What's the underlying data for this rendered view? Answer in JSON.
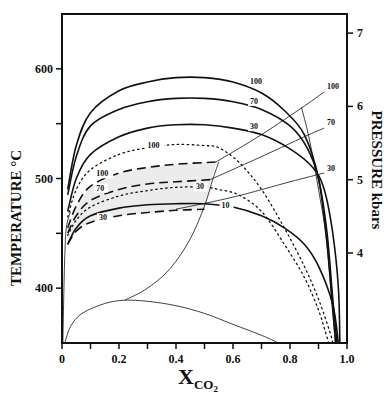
{
  "chart_data": {
    "type": "line",
    "title": "",
    "xlabel": "X",
    "xlabel_subscript": "CO",
    "xlabel_subscript2": "2",
    "ylabel": "TEMPERATURE  °C",
    "y2label": "PRESSURE  kbars",
    "xlim": [
      0,
      1.0
    ],
    "ylim": [
      350,
      650
    ],
    "y2lim": [
      3.3,
      7.3
    ],
    "x_ticks": [
      0,
      0.1,
      0.2,
      0.3,
      0.4,
      0.5,
      0.6,
      0.7,
      0.8,
      0.9,
      1.0
    ],
    "x_tick_labels": [
      {
        "value": 0,
        "label": "0"
      },
      {
        "value": 0.2,
        "label": "0.2"
      },
      {
        "value": 0.4,
        "label": "0.4"
      },
      {
        "value": 0.6,
        "label": "0.6"
      },
      {
        "value": 0.8,
        "label": "0.8"
      },
      {
        "value": 1.0,
        "label": "1.0"
      }
    ],
    "y_ticks": [
      400,
      450,
      500,
      550,
      600
    ],
    "y_tick_labels": [
      {
        "value": 400,
        "label": "400"
      },
      {
        "value": 500,
        "label": "500"
      },
      {
        "value": 600,
        "label": "600"
      }
    ],
    "y2_ticks": [
      {
        "value": 4,
        "label": "4"
      },
      {
        "value": 5,
        "label": "5"
      },
      {
        "value": 6,
        "label": "6"
      },
      {
        "value": 7,
        "label": "7"
      }
    ],
    "grid": false,
    "legend": "none (curves labeled inline by mole % / pressure)",
    "series": [
      {
        "name": "solid 100",
        "style": "solid",
        "label": "100",
        "points": [
          [
            0.02,
            490
          ],
          [
            0.05,
            530
          ],
          [
            0.1,
            560
          ],
          [
            0.2,
            580
          ],
          [
            0.3,
            588
          ],
          [
            0.4,
            592
          ],
          [
            0.5,
            592
          ],
          [
            0.6,
            588
          ],
          [
            0.7,
            578
          ],
          [
            0.78,
            562
          ],
          [
            0.85,
            540
          ],
          [
            0.9,
            500
          ],
          [
            0.93,
            440
          ],
          [
            0.95,
            380
          ],
          [
            0.96,
            350
          ]
        ]
      },
      {
        "name": "solid 70",
        "style": "solid",
        "label": "70",
        "points": [
          [
            0.02,
            485
          ],
          [
            0.05,
            520
          ],
          [
            0.1,
            548
          ],
          [
            0.2,
            563
          ],
          [
            0.3,
            570
          ],
          [
            0.4,
            573
          ],
          [
            0.5,
            573
          ],
          [
            0.6,
            570
          ],
          [
            0.7,
            563
          ],
          [
            0.8,
            548
          ],
          [
            0.86,
            528
          ],
          [
            0.9,
            500
          ],
          [
            0.93,
            450
          ],
          [
            0.95,
            390
          ],
          [
            0.965,
            350
          ]
        ]
      },
      {
        "name": "solid 30",
        "style": "solid",
        "label": "30",
        "points": [
          [
            0.02,
            470
          ],
          [
            0.05,
            500
          ],
          [
            0.1,
            522
          ],
          [
            0.2,
            538
          ],
          [
            0.3,
            546
          ],
          [
            0.4,
            549
          ],
          [
            0.5,
            549
          ],
          [
            0.6,
            546
          ],
          [
            0.7,
            540
          ],
          [
            0.8,
            527
          ],
          [
            0.88,
            510
          ],
          [
            0.92,
            490
          ],
          [
            0.95,
            450
          ],
          [
            0.97,
            400
          ],
          [
            0.975,
            350
          ]
        ]
      },
      {
        "name": "dotted 100",
        "style": "dotted",
        "label": "100",
        "points": [
          [
            0.02,
            465
          ],
          [
            0.05,
            490
          ],
          [
            0.1,
            508
          ],
          [
            0.2,
            522
          ],
          [
            0.3,
            528
          ],
          [
            0.4,
            531
          ],
          [
            0.5,
            530
          ],
          [
            0.55,
            528
          ],
          [
            0.62,
            515
          ],
          [
            0.7,
            490
          ],
          [
            0.78,
            455
          ],
          [
            0.85,
            420
          ],
          [
            0.9,
            390
          ],
          [
            0.94,
            360
          ],
          [
            0.95,
            350
          ]
        ]
      },
      {
        "name": "dashed 100",
        "style": "dashed",
        "label": "100",
        "points": [
          [
            0.02,
            455
          ],
          [
            0.05,
            475
          ],
          [
            0.1,
            493
          ],
          [
            0.2,
            505
          ],
          [
            0.3,
            510
          ],
          [
            0.4,
            513
          ],
          [
            0.54,
            515
          ]
        ]
      },
      {
        "name": "dashed 70",
        "style": "dashed",
        "label": "70",
        "points": [
          [
            0.02,
            450
          ],
          [
            0.05,
            466
          ],
          [
            0.1,
            480
          ],
          [
            0.2,
            490
          ],
          [
            0.3,
            495
          ],
          [
            0.4,
            497
          ],
          [
            0.52,
            499
          ]
        ]
      },
      {
        "name": "dotted 30",
        "style": "dotted",
        "label": "30",
        "points": [
          [
            0.02,
            448
          ],
          [
            0.05,
            462
          ],
          [
            0.1,
            474
          ],
          [
            0.2,
            484
          ],
          [
            0.3,
            489
          ],
          [
            0.4,
            492
          ],
          [
            0.5,
            492
          ],
          [
            0.55,
            490
          ],
          [
            0.62,
            485
          ],
          [
            0.7,
            470
          ],
          [
            0.78,
            440
          ],
          [
            0.85,
            410
          ],
          [
            0.9,
            380
          ],
          [
            0.93,
            355
          ],
          [
            0.935,
            350
          ]
        ]
      },
      {
        "name": "solid 10",
        "style": "solid",
        "label": "10",
        "points": [
          [
            0.02,
            440
          ],
          [
            0.05,
            455
          ],
          [
            0.1,
            466
          ],
          [
            0.2,
            473
          ],
          [
            0.3,
            476
          ],
          [
            0.4,
            477
          ],
          [
            0.5,
            477
          ],
          [
            0.6,
            474
          ],
          [
            0.7,
            466
          ],
          [
            0.78,
            455
          ],
          [
            0.85,
            440
          ],
          [
            0.9,
            420
          ],
          [
            0.95,
            385
          ],
          [
            0.97,
            350
          ]
        ]
      },
      {
        "name": "dashed 30",
        "style": "dashed",
        "label": "30",
        "points": [
          [
            0.02,
            440
          ],
          [
            0.05,
            452
          ],
          [
            0.1,
            460
          ],
          [
            0.2,
            466
          ],
          [
            0.3,
            469
          ],
          [
            0.4,
            471
          ],
          [
            0.5,
            472
          ]
        ]
      },
      {
        "name": "thin boundary upper",
        "style": "thin",
        "points": [
          [
            0.22,
            389
          ],
          [
            0.3,
            400
          ],
          [
            0.38,
            418
          ],
          [
            0.45,
            445
          ],
          [
            0.5,
            475
          ],
          [
            0.53,
            500
          ],
          [
            0.55,
            515
          ]
        ]
      },
      {
        "name": "thin boundary lower",
        "style": "thin",
        "points": [
          [
            0.01,
            350
          ],
          [
            0.03,
            365
          ],
          [
            0.07,
            377
          ],
          [
            0.15,
            386
          ],
          [
            0.22,
            389
          ],
          [
            0.3,
            388
          ],
          [
            0.4,
            384
          ],
          [
            0.5,
            377
          ],
          [
            0.6,
            367
          ],
          [
            0.7,
            357
          ],
          [
            0.76,
            350
          ]
        ]
      },
      {
        "name": "thin left axis curve",
        "style": "thin",
        "points": [
          [
            0.003,
            350
          ],
          [
            0.006,
            390
          ],
          [
            0.01,
            430
          ],
          [
            0.015,
            455
          ],
          [
            0.03,
            470
          ]
        ]
      },
      {
        "name": "pressure line 100",
        "style": "thin",
        "label": "100",
        "points": [
          [
            0.54,
            515
          ],
          [
            0.7,
            540
          ],
          [
            0.85,
            566
          ],
          [
            0.92,
            579
          ]
        ]
      },
      {
        "name": "pressure line 70",
        "style": "thin",
        "label": "70",
        "points": [
          [
            0.52,
            499
          ],
          [
            0.7,
            520
          ],
          [
            0.85,
            538
          ],
          [
            0.92,
            546
          ]
        ]
      },
      {
        "name": "pressure line 30",
        "style": "thin",
        "label": "30",
        "points": [
          [
            0.4,
            472
          ],
          [
            0.6,
            483
          ],
          [
            0.8,
            497
          ],
          [
            0.92,
            505
          ]
        ]
      },
      {
        "name": "steep boundary",
        "style": "thin",
        "points": [
          [
            0.84,
            565
          ],
          [
            0.86,
            545
          ],
          [
            0.88,
            520
          ],
          [
            0.9,
            490
          ],
          [
            0.92,
            460
          ],
          [
            0.93,
            440
          ],
          [
            0.94,
            410
          ],
          [
            0.95,
            380
          ],
          [
            0.96,
            350
          ]
        ]
      }
    ],
    "shaded_region": "between dashed 100 and dashed 30 curves, x 0.02–0.54, light gray"
  }
}
